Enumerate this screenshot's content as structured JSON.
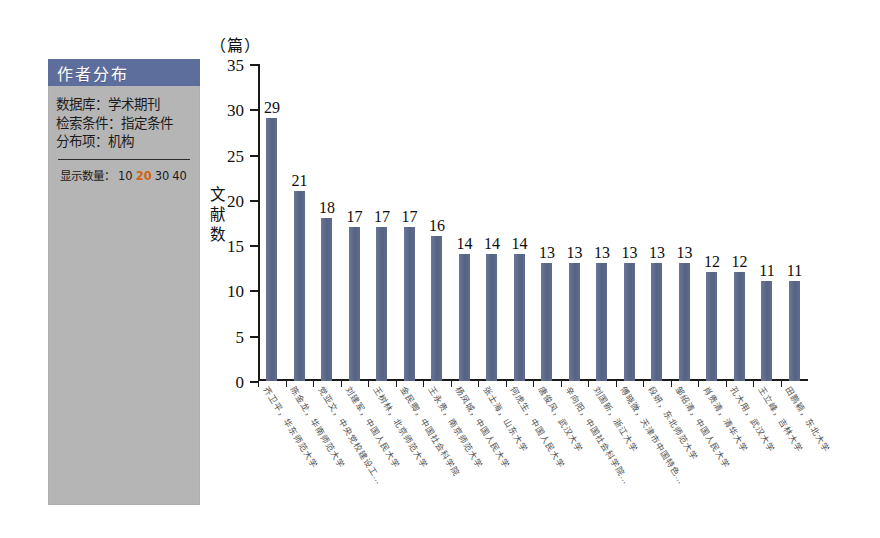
{
  "panel": {
    "title": "作者分布",
    "rows": [
      "数据库：学术期刊",
      "检索条件：指定条件",
      "分布项：机构"
    ],
    "count_label": "显示数量：",
    "count_options": [
      "10",
      "20",
      "30",
      "40"
    ],
    "count_selected": "20",
    "header_color": "#5d6e9d",
    "background_color": "#b5b5b5",
    "active_option_color": "#d1640f"
  },
  "chart_data": {
    "type": "bar",
    "title": "",
    "unit_label": "（篇）",
    "ylabel": "文献数",
    "xlabel": "",
    "ylim": [
      0,
      35
    ],
    "yticks": [
      0,
      5,
      10,
      15,
      20,
      25,
      30,
      35
    ],
    "grid": false,
    "legend": "none",
    "bar_color": "#5d6b8c",
    "categories": [
      "齐卫平，华东师范大学",
      "陈金龙，华南师范大学",
      "党亚文，中央党校建设工…",
      "刘建军，中国人民大学",
      "王树林，北京师范大学",
      "金民卿，中国社会科学院",
      "王永贵，南京师范大学",
      "杨凤城，中国人民大学",
      "张士海，山东大学",
      "何虎生，中国人民大学",
      "唐俊风，武汉大学",
      "辛向阳，中国社会科学院…",
      "刘国新，浙江大学",
      "傅晓微，天津市中国特色…",
      "段妍，东北师范大学",
      "邹绍清，中国人民大学",
      "肖贵清，清华大学",
      "孔大用，武汉大学",
      "王立峰，吉林大学",
      "田鹏颖，东北大学"
    ],
    "values": [
      29,
      21,
      18,
      17,
      17,
      17,
      16,
      14,
      14,
      14,
      13,
      13,
      13,
      13,
      13,
      13,
      12,
      12,
      11,
      11
    ]
  }
}
